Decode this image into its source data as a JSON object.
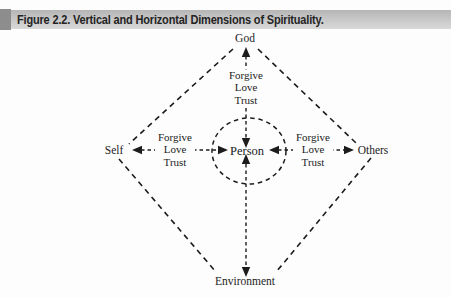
{
  "figure": {
    "caption": "Figure 2.2. Vertical and Horizontal Dimensions of Spirituality."
  },
  "diagram": {
    "center_label": "Person",
    "nodes": {
      "top": "God",
      "left": "Self",
      "right": "Others",
      "bottom": "Environment"
    },
    "edge_labels": {
      "top": {
        "line1": "Forgive",
        "line2": "Love",
        "line3": "Trust"
      },
      "left": {
        "line1": "Forgive",
        "line2": "Love",
        "line3": "Trust"
      },
      "right": {
        "line1": "Forgive",
        "line2": "Love",
        "line3": "Trust"
      }
    },
    "colors": {
      "ink": "#1c1c1c",
      "caption_bar": "#c7c7c7",
      "caption_bar_edge": "#8d8d8d",
      "background": "#fdfdfd"
    }
  }
}
